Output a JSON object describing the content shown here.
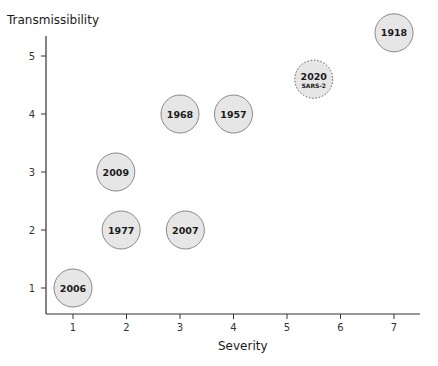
{
  "chart_data": {
    "type": "scatter",
    "title": "",
    "xlabel": "Severity",
    "ylabel": "Transmissibility",
    "xlim": [
      0.5,
      7.5
    ],
    "ylim": [
      0.5,
      5.5
    ],
    "x_ticks": [
      1,
      2,
      3,
      4,
      5,
      6,
      7
    ],
    "y_ticks": [
      1,
      2,
      3,
      4,
      5
    ],
    "grid": false,
    "legend": null,
    "points": [
      {
        "label": "1918",
        "x": 7.0,
        "y": 5.4,
        "style": "solid"
      },
      {
        "label": "2020",
        "sublabel": "SARS-2",
        "x": 5.5,
        "y": 4.6,
        "style": "dotted"
      },
      {
        "label": "1968",
        "x": 3.0,
        "y": 4.0,
        "style": "solid"
      },
      {
        "label": "1957",
        "x": 4.0,
        "y": 4.0,
        "style": "solid"
      },
      {
        "label": "2009",
        "x": 1.8,
        "y": 3.0,
        "style": "solid"
      },
      {
        "label": "1977",
        "x": 1.9,
        "y": 2.0,
        "style": "solid"
      },
      {
        "label": "2007",
        "x": 3.1,
        "y": 2.0,
        "style": "solid"
      },
      {
        "label": "2006",
        "x": 1.0,
        "y": 1.0,
        "style": "solid"
      }
    ],
    "colors": {
      "bubble_fill": "#e6e6e6",
      "bubble_stroke": "#888888",
      "axis": "#333333"
    }
  }
}
